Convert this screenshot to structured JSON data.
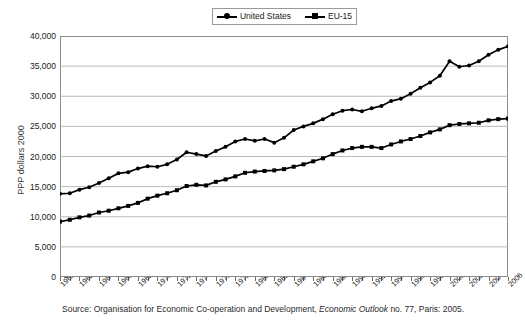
{
  "legend": {
    "position": "top-center",
    "entries": [
      {
        "label": "United States",
        "marker": "round",
        "color": "#000000"
      },
      {
        "label": "EU-15",
        "marker": "square",
        "color": "#000000"
      }
    ]
  },
  "axes": {
    "ylabel": "PPP dollars 2000",
    "yticks": [
      "0",
      "5,000",
      "10,000",
      "15,000",
      "20,000",
      "25,000",
      "30,000",
      "35,000",
      "40,000"
    ],
    "xticks": [
      "1960",
      "1962",
      "1964",
      "1966",
      "1968",
      "1970",
      "1972",
      "1974",
      "1976",
      "1978",
      "1980",
      "1982",
      "1984",
      "1986",
      "1988",
      "1990",
      "1992",
      "1994",
      "1996",
      "1998",
      "2000",
      "2002",
      "2004",
      "2006"
    ]
  },
  "source": {
    "prefix": "Source: Organisation for Economic Co-operation and Development, ",
    "italic": "Economic Outlook",
    "suffix": " no. 77, Paris: 2005."
  },
  "chart_data": {
    "type": "line",
    "title": "",
    "xlabel": "",
    "ylabel": "PPP dollars 2000",
    "xlim": [
      1960,
      2006
    ],
    "ylim": [
      0,
      40000
    ],
    "ytick_step": 5000,
    "grid": true,
    "grid_orientation": "horizontal",
    "legend_position": "top-center",
    "x": [
      1960,
      1961,
      1962,
      1963,
      1964,
      1965,
      1966,
      1967,
      1968,
      1969,
      1970,
      1971,
      1972,
      1973,
      1974,
      1975,
      1976,
      1977,
      1978,
      1979,
      1980,
      1981,
      1982,
      1983,
      1984,
      1985,
      1986,
      1987,
      1988,
      1989,
      1990,
      1991,
      1992,
      1993,
      1994,
      1995,
      1996,
      1997,
      1998,
      1999,
      2000,
      2001,
      2002,
      2003,
      2004,
      2005,
      2006
    ],
    "series": [
      {
        "name": "United States",
        "marker": "round",
        "color": "#000000",
        "values": [
          13800,
          13900,
          14500,
          14900,
          15600,
          16400,
          17200,
          17400,
          18000,
          18400,
          18300,
          18700,
          19500,
          20700,
          20400,
          20100,
          20900,
          21600,
          22500,
          22900,
          22600,
          22900,
          22300,
          23100,
          24400,
          25000,
          25500,
          26200,
          27000,
          27600,
          27800,
          27500,
          28000,
          28400,
          29200,
          29600,
          30400,
          31400,
          32300,
          33400,
          35800,
          34900,
          35100,
          35800,
          36900,
          37700,
          38300
        ]
      },
      {
        "name": "EU-15",
        "marker": "square",
        "color": "#000000",
        "values": [
          9200,
          9500,
          9900,
          10200,
          10700,
          11000,
          11400,
          11800,
          12300,
          13000,
          13500,
          13900,
          14400,
          15100,
          15300,
          15200,
          15800,
          16200,
          16700,
          17300,
          17500,
          17600,
          17700,
          17900,
          18300,
          18700,
          19200,
          19700,
          20400,
          21000,
          21400,
          21600,
          21600,
          21400,
          22000,
          22500,
          22900,
          23400,
          24000,
          24500,
          25200,
          25400,
          25500,
          25600,
          26000,
          26200,
          26300
        ]
      }
    ]
  }
}
